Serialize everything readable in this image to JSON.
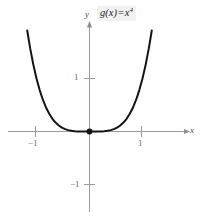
{
  "figure": {
    "function_label": {
      "name": "g",
      "argument": "(x)",
      "equals": "=",
      "base": "x",
      "exponent": "4",
      "full_text": "g(x) = x⁴"
    },
    "axes": {
      "x_label": "x",
      "y_label": "y",
      "x_tick_labels": [
        "−1",
        "1"
      ],
      "y_tick_labels": [
        "1",
        "−1"
      ],
      "axis_color": "#9a9a9a",
      "label_color": "#4a4a4a"
    },
    "curve": {
      "color": "#141414",
      "origin_marker": "filled-dot"
    }
  },
  "chart_data": {
    "type": "line",
    "xlabel": "x",
    "ylabel": "y",
    "xlim": [
      -1.95,
      2.2
    ],
    "ylim": [
      -1.65,
      2.35
    ],
    "xticks": [
      -1,
      1
    ],
    "yticks": [
      -1,
      1
    ],
    "xtick_labels": [
      "−1",
      "1"
    ],
    "ytick_labels": [
      "−1",
      "1"
    ],
    "grid": false,
    "legend": "none",
    "annotations": [
      {
        "text": "g(x) = x⁴",
        "position": "top-right"
      }
    ],
    "markers": [
      {
        "x": 0,
        "y": 0,
        "style": "filled-circle",
        "label": "origin"
      }
    ],
    "series": [
      {
        "name": "g(x) = x^4",
        "expression": "x**4",
        "color": "#141414",
        "x": [
          -1.175,
          -1.12,
          -1.06,
          -1.0,
          -0.94,
          -0.88,
          -0.82,
          -0.76,
          -0.7,
          -0.64,
          -0.58,
          -0.52,
          -0.46,
          -0.4,
          -0.34,
          -0.28,
          -0.22,
          -0.16,
          -0.1,
          -0.04,
          0.0,
          0.04,
          0.1,
          0.16,
          0.22,
          0.28,
          0.34,
          0.4,
          0.46,
          0.52,
          0.58,
          0.64,
          0.7,
          0.76,
          0.82,
          0.88,
          0.94,
          1.0,
          1.06,
          1.12,
          1.175
        ],
        "y": [
          1.906,
          1.573,
          1.262,
          1.0,
          0.781,
          0.5997,
          0.4521,
          0.3336,
          0.2401,
          0.1678,
          0.1132,
          0.0731,
          0.0448,
          0.0256,
          0.0134,
          0.0061,
          0.0023,
          0.0007,
          0.0001,
          0.0,
          0.0,
          0.0,
          0.0001,
          0.0007,
          0.0023,
          0.0061,
          0.0134,
          0.0256,
          0.0448,
          0.0731,
          0.1132,
          0.1678,
          0.2401,
          0.3336,
          0.4521,
          0.5997,
          0.781,
          1.0,
          1.262,
          1.573,
          1.906
        ]
      }
    ]
  }
}
